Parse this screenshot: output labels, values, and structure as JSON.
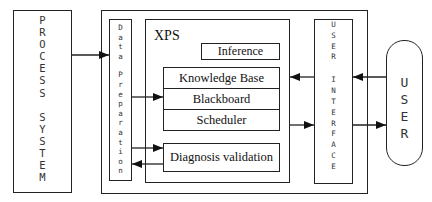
{
  "diagram": {
    "process_system": {
      "label": "PROCESS SYSTEM",
      "letters": [
        "P",
        "R",
        "O",
        "C",
        "E",
        "S",
        "S",
        " ",
        "S",
        "Y",
        "S",
        "T",
        "E",
        "M"
      ]
    },
    "data_preparation": {
      "label": "Data Preparation",
      "letters": [
        "D",
        "a",
        "t",
        "a",
        " ",
        "P",
        "r",
        "e",
        "p",
        "a",
        "r",
        "a",
        "t",
        "i",
        "o",
        "n"
      ]
    },
    "xps": {
      "title": "XPS",
      "inference": "Inference",
      "knowledge_base": "Knowledge Base",
      "blackboard": "Blackboard",
      "scheduler": "Scheduler",
      "diagnosis_validation": "Diagnosis validation"
    },
    "user_interface": {
      "label": "USER INTERFACE",
      "letters": [
        "U",
        "S",
        "E",
        "R",
        " ",
        "I",
        "N",
        "T",
        "E",
        "R",
        "F",
        "A",
        "C",
        "E"
      ]
    },
    "user": {
      "label": "USER",
      "letters": [
        "U",
        "S",
        "E",
        "R"
      ]
    },
    "connections": [
      {
        "from": "process_system",
        "to": "data_preparation"
      },
      {
        "from": "data_preparation",
        "to": "blackboard"
      },
      {
        "from": "data_preparation",
        "to": "diagnosis_validation"
      },
      {
        "from": "diagnosis_validation",
        "to": "data_preparation"
      },
      {
        "from": "user_interface",
        "to": "knowledge_base"
      },
      {
        "from": "scheduler",
        "to": "user_interface"
      },
      {
        "from": "user",
        "to": "user_interface"
      },
      {
        "from": "user_interface",
        "to": "user"
      }
    ]
  }
}
